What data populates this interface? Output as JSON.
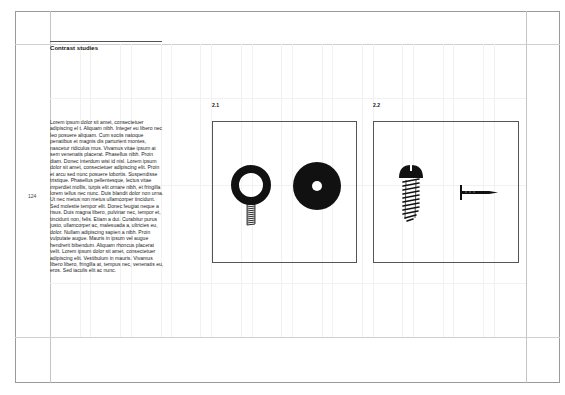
{
  "page": {
    "section_title": "Contrast studies",
    "page_number": "124",
    "body_text": "Lorem ipsum dolor sit amet, consectetuer adipiscing el t. Aliquam nibh. Integer eu libero nec leo posuere aliquam. Cum sociis natoque penatibus et magnis dis parturient montes, nascetur ridiculus mus. Vivamus vitae ipsum at sem venenatis placerat. Phasellus nibh. Proin diam. Donec interdum wisi id nisl. Lorem ipsum dolor sit amet, consectetuer adipiscing elit. Proin et arcu sed nunc posuere lobortis. Suspendisse tristique. Phasellus pellentesque, lectus vitae imperdiet mollis, turpis elit ornare nibh, et fringilla lorem tellus nec nunc. Duis blandit dolor non urna. Ut nec metus non metus ullamcorper tincidunt. Sed molestie tempor elit. Donec feugiat neque a risus. Duis magna libero, pulvinar nec, tempor et, tincidunt non, felis. Etiam a dui. Curabitur purus justo, ullamcorper ac, malesuada a, ultricies eu, dolor. Nullam adipiscing sapien a nibh. Proin vulputate augue. Mauris in ipsum vel augue hendrerit bibendum. Aliquam rhoncus placerat velit. Lorem ipsum dolor sit amet, consectetuer adipiscing elit. Vestibulum in mauris. Vivamus libero libero, fringilla at, tempus nec, venenatis eu, eros. Sed iaculis elit ac nunc."
  },
  "figures": [
    {
      "label": "2.1",
      "items": [
        "eye-bolt-icon",
        "washer-icon"
      ]
    },
    {
      "label": "2.2",
      "items": [
        "screw-icon",
        "nail-icon"
      ]
    }
  ],
  "colors": {
    "frame": "#9a9a9a",
    "grid": "#f1f1f1",
    "ink": "#111111"
  }
}
